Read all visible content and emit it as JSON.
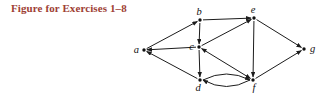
{
  "title": "Figure for Exercises 1–8",
  "colors": {
    "title": "#9e4034",
    "edge": "#1c1c1c",
    "vertex": "#111111",
    "label": "#111111",
    "background": "#ffffff"
  },
  "graph": {
    "vertices": [
      {
        "id": "a",
        "label": "a",
        "x": 144,
        "y": 50,
        "label_dx": -5,
        "label_dy": 3,
        "anchor": "end"
      },
      {
        "id": "b",
        "label": "b",
        "x": 200,
        "y": 20,
        "label_dx": -1,
        "label_dy": -5,
        "anchor": "middle"
      },
      {
        "id": "c",
        "label": "c",
        "x": 199,
        "y": 47,
        "label_dx": -5,
        "label_dy": 3,
        "anchor": "end"
      },
      {
        "id": "d",
        "label": "d",
        "x": 200,
        "y": 80,
        "label_dx": -2,
        "label_dy": 11,
        "anchor": "middle"
      },
      {
        "id": "e",
        "label": "e",
        "x": 254,
        "y": 18,
        "label_dx": -1,
        "label_dy": -5,
        "anchor": "middle"
      },
      {
        "id": "f",
        "label": "f",
        "x": 253,
        "y": 80,
        "label_dx": 1,
        "label_dy": 11,
        "anchor": "middle"
      },
      {
        "id": "g",
        "label": "g",
        "x": 304,
        "y": 49,
        "label_dx": 6,
        "label_dy": 3,
        "anchor": "start"
      }
    ],
    "edges": [
      {
        "from": "a",
        "to": "b",
        "dir": "forward",
        "shape": "line"
      },
      {
        "from": "b",
        "to": "e",
        "dir": "forward",
        "shape": "line"
      },
      {
        "from": "b",
        "to": "c",
        "dir": "forward",
        "shape": "line"
      },
      {
        "from": "c",
        "to": "a",
        "dir": "forward",
        "shape": "line"
      },
      {
        "from": "c",
        "to": "e",
        "dir": "forward",
        "shape": "line"
      },
      {
        "from": "c",
        "to": "d",
        "dir": "forward",
        "shape": "line"
      },
      {
        "from": "c",
        "to": "f",
        "dir": "both",
        "shape": "line"
      },
      {
        "from": "d",
        "to": "a",
        "dir": "forward",
        "shape": "line"
      },
      {
        "from": "d",
        "to": "f",
        "dir": "forward",
        "shape": "arc",
        "bulge": -12
      },
      {
        "from": "e",
        "to": "f",
        "dir": "forward",
        "shape": "line"
      },
      {
        "from": "e",
        "to": "g",
        "dir": "forward",
        "shape": "line"
      },
      {
        "from": "f",
        "to": "d",
        "dir": "forward",
        "shape": "arc",
        "bulge": -13
      },
      {
        "from": "f",
        "to": "g",
        "dir": "forward",
        "shape": "line"
      }
    ]
  }
}
